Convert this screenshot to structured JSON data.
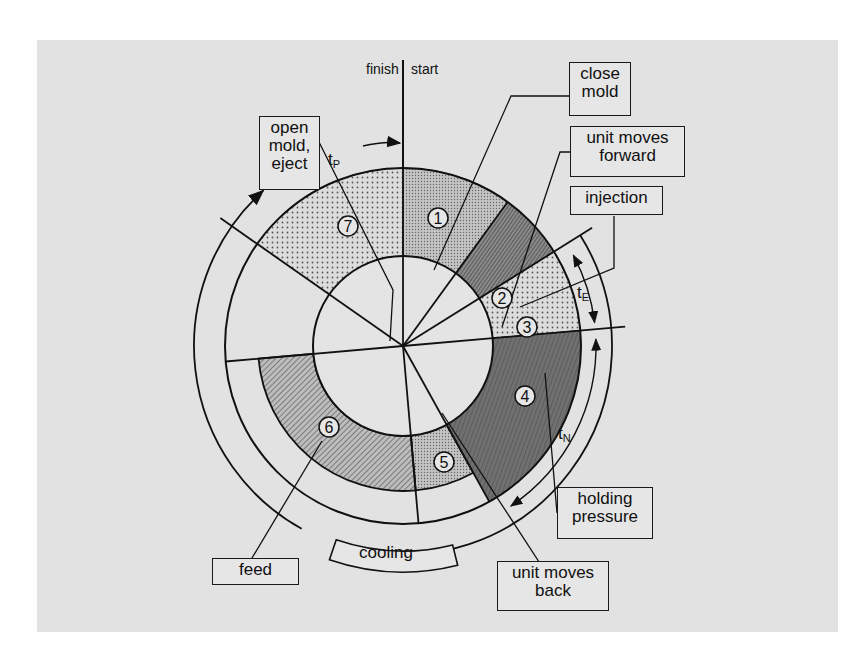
{
  "diagram": {
    "center": [
      403,
      346
    ],
    "radii": {
      "hub": 90,
      "ring": 178,
      "outer": 209,
      "feed_outer": 145
    },
    "markers": {
      "finish": "finish",
      "start": "start"
    },
    "phases": [
      {
        "id": 1,
        "number": "1",
        "label": "close mold",
        "start_deg": 0,
        "end_deg": 36,
        "fill": "dots-fine"
      },
      {
        "id": 2,
        "number": "2",
        "label": "unit moves forward",
        "start_deg": 36,
        "end_deg": 58,
        "fill": "hatch-dense"
      },
      {
        "id": 3,
        "number": "3",
        "label": "injection",
        "start_deg": 58,
        "end_deg": 85,
        "fill": "dots"
      },
      {
        "id": 4,
        "number": "4",
        "label": "holding pressure",
        "start_deg": 85,
        "end_deg": 151,
        "fill": "dark"
      },
      {
        "id": 5,
        "number": "5",
        "label": "unit moves back",
        "start_deg": 151,
        "end_deg": 175,
        "fill": "dots-fine",
        "outer_r": 145
      },
      {
        "id": 6,
        "number": "6",
        "label": "feed",
        "start_deg": 175,
        "end_deg": 265,
        "fill": "hatch",
        "outer_r": 145
      },
      {
        "id": 7,
        "number": "7",
        "label": "open mold, eject",
        "start_deg": 305,
        "end_deg": 360,
        "fill": "dots"
      }
    ],
    "labels": {
      "close_mold": "close\nmold",
      "unit_moves_forward": "unit moves\nforward",
      "injection": "injection",
      "holding_pressure": "holding\npressure",
      "unit_moves_back": "unit moves\nback",
      "feed": "feed",
      "cooling": "cooling",
      "open_mold_eject": "open\nmold,\neject"
    },
    "times": {
      "tP": {
        "base": "t",
        "sub": "P"
      },
      "tE": {
        "base": "t",
        "sub": "E"
      },
      "tN": {
        "base": "t",
        "sub": "N"
      }
    },
    "colors": {
      "panel": "#e2e2e2",
      "line": "#111111",
      "dark_fill": "#6e6e6e",
      "dots_fill": "#c8c8c8",
      "hatch_fill": "#9a9a9a"
    }
  }
}
